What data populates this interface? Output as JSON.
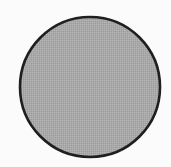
{
  "figure": {
    "type": "circle",
    "shape": {
      "cx": 90,
      "cy": 87,
      "r": 70,
      "fill": "#a9a9a9",
      "fill_pattern_light": "#b4b4b4",
      "fill_pattern_dark": "#9c9c9c",
      "stroke": "#1f1f1f",
      "stroke_width": 2.6
    },
    "background": "#fbfbfb"
  }
}
